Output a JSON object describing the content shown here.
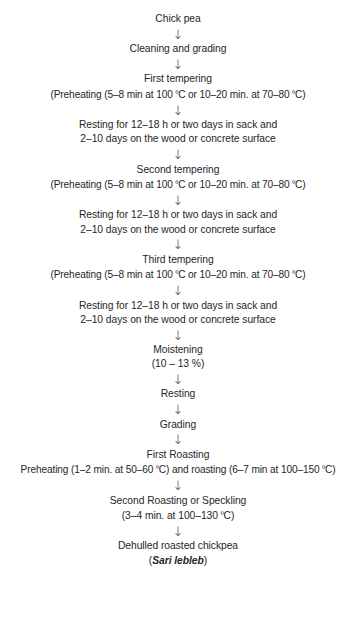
{
  "figure": {
    "type": "process-flowchart",
    "arrow_glyph": "↓",
    "text_color": "#262626",
    "background_color": "#ffffff",
    "degree_symbol": "º",
    "steps": [
      {
        "id": "chick-pea",
        "lines": [
          "Chick pea"
        ]
      },
      {
        "id": "cleaning-and-grading",
        "lines": [
          "Cleaning and grading"
        ]
      },
      {
        "id": "first-tempering",
        "lines": [
          "First tempering",
          "(Preheating (5–8 min at 100 ºC or 10–20 min. at 70–80 ºC)"
        ]
      },
      {
        "id": "resting-1",
        "lines": [
          "Resting for 12–18 h or two days in sack and",
          "2–10 days on the wood or concrete surface"
        ]
      },
      {
        "id": "second-tempering",
        "lines": [
          "Second tempering",
          "(Preheating (5–8 min at 100 ºC or 10–20 min. at 70–80 ºC)"
        ]
      },
      {
        "id": "resting-2",
        "lines": [
          "Resting for 12–18 h or two days in sack and",
          "2–10 days on the wood or concrete surface"
        ]
      },
      {
        "id": "third-tempering",
        "lines": [
          "Third tempering",
          "(Preheating (5–8 min at 100 ºC or 10–20 min. at 70–80 ºC)"
        ]
      },
      {
        "id": "resting-3",
        "lines": [
          "Resting for 12–18 h or two days in sack and",
          "2–10 days on the wood or concrete surface"
        ]
      },
      {
        "id": "moistening",
        "lines": [
          "Moistening",
          "(10 – 13 %)"
        ]
      },
      {
        "id": "resting-4",
        "lines": [
          "Resting"
        ]
      },
      {
        "id": "grading",
        "lines": [
          "Grading"
        ]
      },
      {
        "id": "first-roasting",
        "lines": [
          "First Roasting",
          "Preheating (1–2 min. at 50–60 ºC) and roasting (6–7 min at 100–150 ºC)"
        ]
      },
      {
        "id": "second-roasting",
        "lines": [
          "Second Roasting or Speckling",
          "(3–4 min. at 100–130 ºC)"
        ]
      },
      {
        "id": "dehulled-roasted-chickpea",
        "lines": [
          "Dehulled roasted chickpea"
        ],
        "product_name_prefix": "(",
        "product_name": "Sari lebleb",
        "product_name_suffix": ")"
      }
    ]
  }
}
